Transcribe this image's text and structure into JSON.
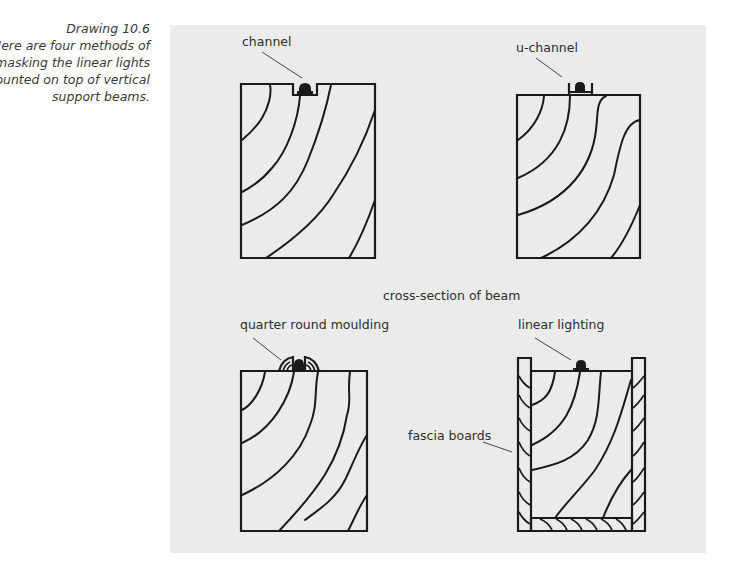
{
  "caption": {
    "title": "Drawing 10.6",
    "lines": [
      "Here are four methods of",
      "masking the linear lights",
      "mounted on top of vertical",
      "support beams."
    ]
  },
  "figure": {
    "center_label": "cross-section of beam",
    "panels": [
      {
        "id": "channel",
        "label": "channel"
      },
      {
        "id": "u-channel",
        "label": "u-channel"
      },
      {
        "id": "quarter-round",
        "label": "quarter round moulding"
      },
      {
        "id": "fascia",
        "label": "linear lighting",
        "secondary_label": "fascia boards"
      }
    ]
  },
  "colors": {
    "panel_bg": "#ebebeb",
    "ink": "#1a1a1a",
    "page_bg": "#ffffff"
  }
}
